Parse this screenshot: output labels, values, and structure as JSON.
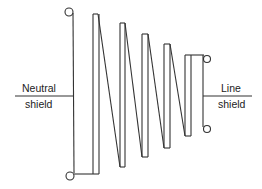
{
  "diagram": {
    "type": "winding-schematic",
    "left_label": {
      "line1": "Neutral",
      "line2": "shield"
    },
    "right_label": {
      "line1": "Line",
      "line2": "shield"
    },
    "stroke_color": "#333333",
    "background": "#ffffff",
    "sections": [
      {
        "index": 1,
        "top": 14,
        "bottom": 174
      },
      {
        "index": 2,
        "top": 23,
        "bottom": 167
      },
      {
        "index": 3,
        "top": 34,
        "bottom": 157
      },
      {
        "index": 4,
        "top": 44,
        "bottom": 148
      },
      {
        "index": 5,
        "top": 55,
        "bottom": 136
      }
    ],
    "terminals": [
      {
        "name": "neutral-top",
        "cx": 69,
        "cy": 12
      },
      {
        "name": "neutral-bottom",
        "cx": 70,
        "cy": 176
      },
      {
        "name": "line-top",
        "cx": 207,
        "cy": 59
      },
      {
        "name": "line-bottom",
        "cx": 207,
        "cy": 129
      }
    ]
  }
}
